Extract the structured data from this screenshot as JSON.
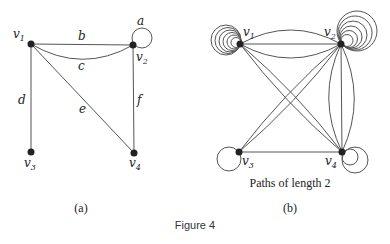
{
  "figure": {
    "caption": "Figure 4",
    "panel_a": {
      "label": "(a)",
      "vertices": [
        {
          "id": "v1",
          "name": "v",
          "sub": "1"
        },
        {
          "id": "v2",
          "name": "v",
          "sub": "2"
        },
        {
          "id": "v3",
          "name": "v",
          "sub": "3"
        },
        {
          "id": "v4",
          "name": "v",
          "sub": "4"
        }
      ],
      "edges": [
        {
          "label": "a",
          "from": "v2",
          "to": "v2",
          "type": "loop"
        },
        {
          "label": "b",
          "from": "v1",
          "to": "v2",
          "type": "straight"
        },
        {
          "label": "c",
          "from": "v1",
          "to": "v2",
          "type": "curved"
        },
        {
          "label": "d",
          "from": "v1",
          "to": "v3",
          "type": "straight"
        },
        {
          "label": "e",
          "from": "v1",
          "to": "v4",
          "type": "straight"
        },
        {
          "label": "f",
          "from": "v2",
          "to": "v4",
          "type": "straight"
        }
      ]
    },
    "panel_b": {
      "label": "(b)",
      "subtitle": "Paths of length 2",
      "vertices": [
        {
          "id": "v1",
          "name": "v",
          "sub": "1",
          "loops": 6
        },
        {
          "id": "v2",
          "name": "v",
          "sub": "2",
          "loops": 6
        },
        {
          "id": "v3",
          "name": "v",
          "sub": "3",
          "loops": 1
        },
        {
          "id": "v4",
          "name": "v",
          "sub": "4",
          "loops": 2
        }
      ],
      "edge_counts": {
        "v1-v2": 3,
        "v1-v4": 2,
        "v2-v3": 2,
        "v2-v4": 3,
        "v3-v4": 1
      }
    }
  }
}
